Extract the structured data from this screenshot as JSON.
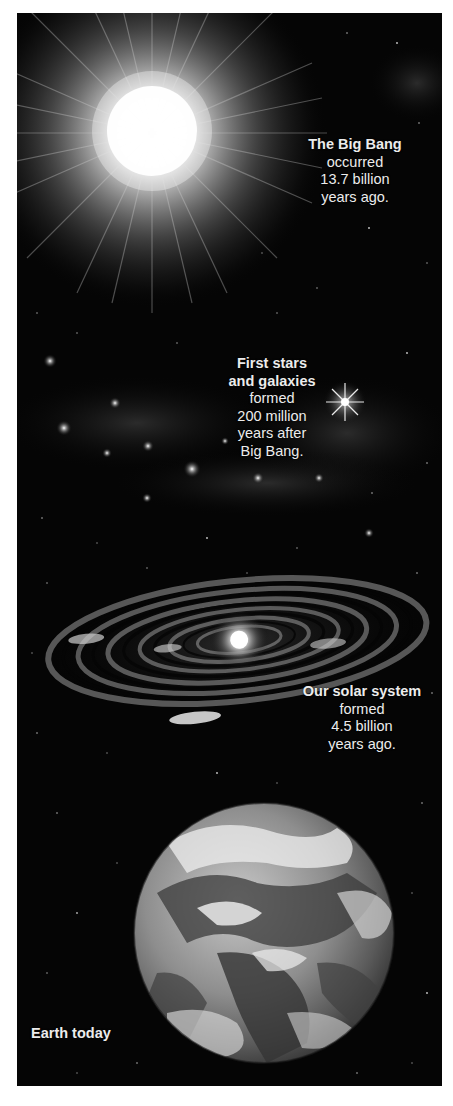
{
  "figure": {
    "background_color": "#050505",
    "margin_color": "#ffffff",
    "text_color": "#ececec",
    "scenes": [
      {
        "id": "big-bang",
        "image": "big-bang-explosion",
        "caption": {
          "bold": [
            "The Big Bang"
          ],
          "regular": [
            "occurred",
            "13.7 billion",
            "years ago."
          ]
        }
      },
      {
        "id": "first-stars",
        "image": "early-stars-and-galaxies",
        "caption": {
          "bold": [
            "First stars",
            "and galaxies"
          ],
          "regular": [
            "formed",
            "200 million",
            "years after",
            "Big Bang."
          ]
        }
      },
      {
        "id": "solar-system",
        "image": "spiral-galaxy",
        "caption": {
          "bold": [
            "Our solar system"
          ],
          "regular": [
            "formed",
            "4.5 billion",
            "years ago."
          ]
        }
      },
      {
        "id": "earth",
        "image": "earth-globe",
        "caption": {
          "bold": [
            "Earth today"
          ],
          "regular": []
        }
      }
    ]
  }
}
